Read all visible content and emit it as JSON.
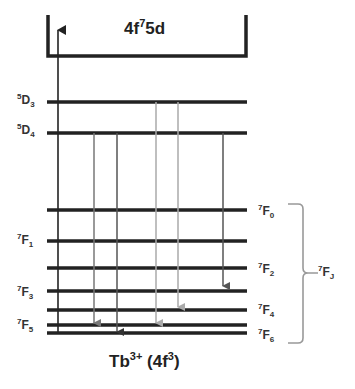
{
  "diagram": {
    "top_band_label": {
      "base": "4f",
      "sup": "7",
      "rest": "5d"
    },
    "bottom_label": {
      "base": "Tb",
      "sup": "3+",
      "mid": " (4f",
      "sup2": "3",
      "end": ")"
    },
    "group_label": {
      "sup": "7",
      "base": "F",
      "sub": "J"
    },
    "levels": [
      {
        "id": "5D3",
        "sup": "5",
        "base": "D",
        "sub": "3",
        "side": "left",
        "y": 102
      },
      {
        "id": "5D4",
        "sup": "5",
        "base": "D",
        "sub": "4",
        "side": "left",
        "y": 133
      },
      {
        "id": "7F0",
        "sup": "7",
        "base": "F",
        "sub": "0",
        "side": "right",
        "y": 210
      },
      {
        "id": "7F1",
        "sup": "7",
        "base": "F",
        "sub": "1",
        "side": "left",
        "y": 241
      },
      {
        "id": "7F2",
        "sup": "7",
        "base": "F",
        "sub": "2",
        "side": "right",
        "y": 268
      },
      {
        "id": "7F3",
        "sup": "7",
        "base": "F",
        "sub": "3",
        "side": "left",
        "y": 291
      },
      {
        "id": "7F4",
        "sup": "7",
        "base": "F",
        "sub": "4",
        "side": "right",
        "y": 310
      },
      {
        "id": "7F5",
        "sup": "5",
        "base": "F",
        "sub": "5",
        "side": "left",
        "y": 325
      },
      {
        "id": "7F6",
        "sup": "7",
        "base": "F",
        "sub": "6",
        "side": "right",
        "y": 333
      }
    ],
    "transitions": [
      {
        "type": "excitation",
        "from": "7F6",
        "to": "4f75d",
        "color": "#222222"
      },
      {
        "type": "emission",
        "from": "5D4",
        "to": "7F5",
        "color": "#666666"
      },
      {
        "type": "emission",
        "from": "5D4",
        "to": "7F6",
        "color": "#444444"
      },
      {
        "type": "emission",
        "from": "5D3",
        "to": "7F5",
        "color": "#aaaaaa"
      },
      {
        "type": "emission",
        "from": "5D3",
        "to": "7F4",
        "color": "#aaaaaa"
      },
      {
        "type": "emission",
        "from": "5D4",
        "to": "7F3",
        "color": "#555555"
      }
    ]
  }
}
